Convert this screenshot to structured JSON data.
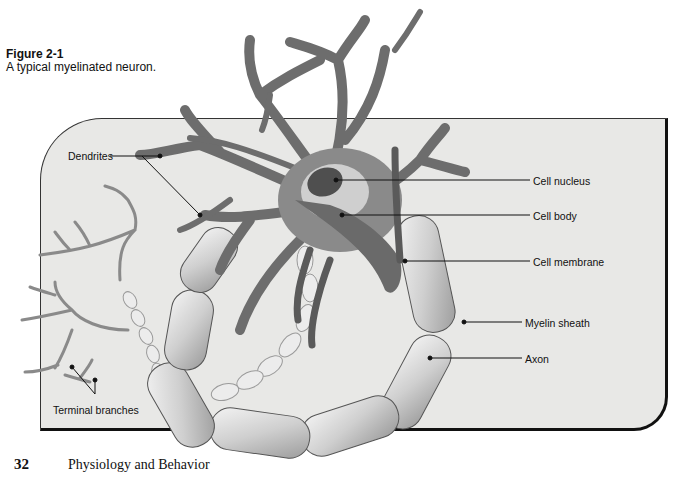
{
  "figure": {
    "number": "Figure 2-1",
    "caption": "A typical myelinated neuron."
  },
  "labels": {
    "dendrites": "Dendrites",
    "cell_nucleus": "Cell nucleus",
    "cell_body": "Cell body",
    "cell_membrane": "Cell membrane",
    "myelin_sheath": "Myelin sheath",
    "axon": "Axon",
    "terminal_branches": "Terminal branches"
  },
  "footer": {
    "page_number": "32",
    "running_title": "Physiology and Behavior"
  },
  "colors": {
    "panel_bg": "#e8e8e6",
    "neuron": "#7a7a7a",
    "myelin": "#d9d9d9",
    "ink": "#111111"
  }
}
